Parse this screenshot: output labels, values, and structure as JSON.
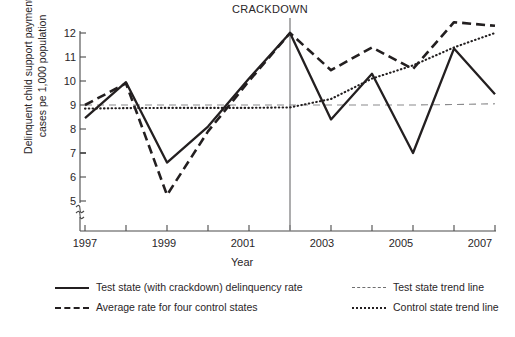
{
  "chart_data": {
    "type": "line",
    "title": "",
    "xlabel": "Year",
    "ylabel": "Delinquent child support payment cases pe  1,000 population",
    "x": [
      1997,
      1998,
      1999,
      2000,
      2001,
      2002,
      2003,
      2004,
      2005,
      2006,
      2007
    ],
    "xtick_labels": [
      "1997",
      "1999",
      "2001",
      "2003",
      "2005",
      "2007"
    ],
    "xtick_values": [
      1997,
      1999,
      2001,
      2003,
      2005,
      2007
    ],
    "xlim": [
      1997,
      2007
    ],
    "ytick_labels": [
      "5",
      "6",
      "7",
      "8",
      "9",
      "10",
      "11",
      "12"
    ],
    "ytick_values": [
      5,
      6,
      7,
      8,
      9,
      10,
      11,
      12
    ],
    "ylim": [
      5,
      12
    ],
    "y_axis_break": true,
    "grid": false,
    "legend_position": "below-plot",
    "annotations": [
      {
        "text": "CRACKDOWN",
        "x": 2002,
        "type": "vertical-line-label"
      }
    ],
    "series": [
      {
        "name": "Test state (with crackdown) delinquency rate",
        "style": "solid",
        "color": "#231f20",
        "values": [
          8.45,
          9.95,
          6.6,
          8.1,
          10.1,
          12.0,
          8.4,
          10.3,
          7.0,
          11.35,
          9.45
        ]
      },
      {
        "name": "Average rate for four control states",
        "style": "dashed",
        "color": "#231f20",
        "values": [
          9.0,
          9.9,
          5.25,
          7.9,
          10.0,
          12.0,
          10.45,
          11.4,
          10.5,
          12.45,
          12.3
        ]
      },
      {
        "name": "Test state trend line",
        "style": "thin-dashed",
        "color": "#6f6f70",
        "values": [
          9.0,
          9.0,
          9.0,
          9.0,
          9.0,
          9.0,
          9.0,
          9.0,
          9.0,
          9.02,
          9.05
        ]
      },
      {
        "name": "Control state trend line",
        "style": "dotted",
        "color": "#231f20",
        "values": [
          8.85,
          8.87,
          8.88,
          8.88,
          8.88,
          8.9,
          9.25,
          10.1,
          10.65,
          11.4,
          12.0
        ]
      }
    ]
  },
  "axis": {
    "y_title": "Delinquent child support payment\ncases pe  1,000 population",
    "x_title": "Year"
  },
  "annotation": {
    "crackdown": "CRACKDOWN"
  },
  "legend": {
    "items": [
      {
        "label": "Test state (with crackdown) delinquency rate",
        "icon": "solid-line-swatch"
      },
      {
        "label": "Average rate for four control states",
        "icon": "dashed-line-swatch"
      },
      {
        "label": "Test state trend line",
        "icon": "thin-dashed-line-swatch"
      },
      {
        "label": "Control state trend line",
        "icon": "dotted-line-swatch"
      }
    ]
  },
  "colors": {
    "ink": "#231f20",
    "trend_gray": "#6f6f70",
    "axis": "#4a4a4a",
    "background": "#ffffff"
  }
}
